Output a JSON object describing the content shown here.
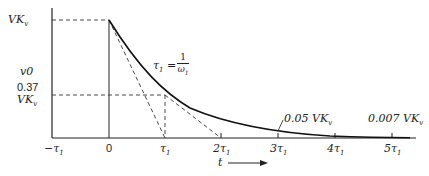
{
  "diagram": {
    "type": "exponential-decay-plot",
    "y_axis_label": "v0",
    "x_axis_label": "t",
    "y_labels": {
      "top": "VK",
      "top_sub": "v",
      "mid_num": "0.37",
      "mid": "VK",
      "mid_sub": "v"
    },
    "x_ticks": [
      "−τ1",
      "0",
      "τ1",
      "2τ1",
      "3τ1",
      "4τ1",
      "5τ1"
    ],
    "x_tick_display": [
      {
        "base": "−τ",
        "sub": "1"
      },
      {
        "base": "0",
        "sub": ""
      },
      {
        "base": "τ",
        "sub": "1"
      },
      {
        "base": "2τ",
        "sub": "1"
      },
      {
        "base": "3τ",
        "sub": "1"
      },
      {
        "base": "4τ",
        "sub": "1"
      },
      {
        "base": "5τ",
        "sub": "1"
      }
    ],
    "formula": {
      "lhs": "τ",
      "lhs_sub": "1",
      "num": "1",
      "den": "ω",
      "den_sub": "1"
    },
    "annotations": [
      {
        "text": "0.05 VK",
        "sub": "v",
        "at": "3τ1"
      },
      {
        "text": "0.007 VK",
        "sub": "v",
        "at": "5τ1"
      }
    ]
  }
}
